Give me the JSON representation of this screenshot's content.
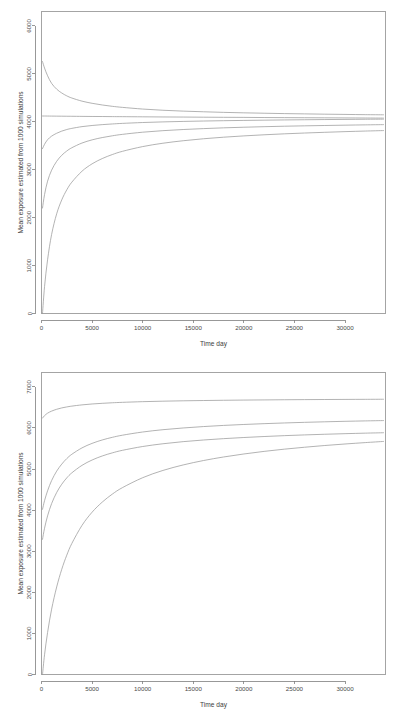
{
  "figure": {
    "background_color": "#ffffff",
    "line_color": "#9a9a9a",
    "axis_color": "#7e7e7e",
    "panel_count": 2
  },
  "chart_data": [
    {
      "id": "top-panel",
      "type": "line",
      "title": "",
      "xlabel": "Time day",
      "ylabel": "Mean exposure estimated from 1000 simulations",
      "xlim": [
        0,
        34000
      ],
      "ylim": [
        0,
        6300
      ],
      "xticks": [
        0,
        5000,
        10000,
        15000,
        20000,
        25000,
        30000
      ],
      "xticklabels": [
        "0",
        "5000",
        "10000",
        "15000",
        "20000",
        "25000",
        "30000"
      ],
      "yticks": [
        0,
        1000,
        2000,
        3000,
        4000,
        5000,
        6000
      ],
      "yticklabels": [
        "0",
        "1000",
        "2000",
        "3000",
        "4000",
        "5000",
        "6000"
      ],
      "grid": false,
      "legend": "none",
      "x": [
        100,
        300,
        600,
        1000,
        1500,
        2000,
        2500,
        3000,
        4000,
        5000,
        6000,
        7000,
        8000,
        10000,
        12000,
        14000,
        16000,
        18000,
        20000,
        22000,
        24000,
        26000,
        28000,
        30000,
        32000,
        33800
      ],
      "series": [
        {
          "name": "curve-1-decreasing",
          "values": [
            5255,
            5120,
            4960,
            4800,
            4680,
            4600,
            4540,
            4495,
            4430,
            4385,
            4350,
            4322,
            4300,
            4265,
            4240,
            4222,
            4208,
            4196,
            4186,
            4178,
            4170,
            4164,
            4158,
            4153,
            4148,
            4145
          ]
        },
        {
          "name": "curve-2-flat",
          "values": [
            4120,
            4120,
            4119,
            4118,
            4117,
            4116,
            4115,
            4114,
            4112,
            4110,
            4109,
            4107,
            4106,
            4103,
            4100,
            4098,
            4095,
            4093,
            4091,
            4088,
            4086,
            4084,
            4082,
            4080,
            4078,
            4076
          ]
        },
        {
          "name": "curve-3-rising-high",
          "values": [
            3440,
            3530,
            3625,
            3700,
            3760,
            3805,
            3838,
            3862,
            3898,
            3922,
            3940,
            3954,
            3966,
            3984,
            3997,
            4007,
            4015,
            4022,
            4028,
            4033,
            4038,
            4042,
            4046,
            4049,
            4052,
            4054
          ]
        },
        {
          "name": "curve-4-rising-mid",
          "values": [
            2200,
            2480,
            2760,
            2990,
            3175,
            3300,
            3390,
            3458,
            3556,
            3622,
            3670,
            3707,
            3737,
            3782,
            3814,
            3838,
            3857,
            3873,
            3886,
            3897,
            3907,
            3915,
            3922,
            3929,
            3935,
            3940
          ]
        },
        {
          "name": "curve-5-rising-low",
          "values": [
            0,
            560,
            1120,
            1650,
            2080,
            2370,
            2580,
            2740,
            2968,
            3122,
            3232,
            3316,
            3383,
            3482,
            3552,
            3604,
            3645,
            3678,
            3705,
            3728,
            3748,
            3765,
            3780,
            3794,
            3806,
            3816
          ]
        }
      ]
    },
    {
      "id": "bottom-panel",
      "type": "line",
      "title": "",
      "xlabel": "Time day",
      "ylabel": "Mean exposure estimated from 1000 simulations",
      "xlim": [
        0,
        34000
      ],
      "ylim": [
        0,
        7350
      ],
      "xticks": [
        0,
        5000,
        10000,
        15000,
        20000,
        25000,
        30000
      ],
      "xticklabels": [
        "0",
        "5000",
        "10000",
        "15000",
        "20000",
        "25000",
        "30000"
      ],
      "yticks": [
        0,
        1000,
        2000,
        3000,
        4000,
        5000,
        6000,
        7000
      ],
      "yticklabels": [
        "0",
        "1000",
        "2000",
        "3000",
        "4000",
        "5000",
        "6000",
        "7000"
      ],
      "grid": false,
      "legend": "none",
      "x": [
        100,
        300,
        600,
        1000,
        1500,
        2000,
        2500,
        3000,
        4000,
        5000,
        6000,
        7000,
        8000,
        10000,
        12000,
        14000,
        16000,
        18000,
        20000,
        22000,
        24000,
        26000,
        28000,
        30000,
        32000,
        33800
      ],
      "series": [
        {
          "name": "curve-1-top",
          "values": [
            6240,
            6300,
            6360,
            6410,
            6455,
            6488,
            6512,
            6532,
            6562,
            6584,
            6600,
            6613,
            6624,
            6640,
            6652,
            6661,
            6668,
            6674,
            6679,
            6683,
            6687,
            6690,
            6693,
            6695,
            6697,
            6699
          ]
        },
        {
          "name": "curve-2-upper-mid",
          "values": [
            4020,
            4230,
            4470,
            4720,
            4950,
            5120,
            5255,
            5360,
            5515,
            5625,
            5708,
            5772,
            5824,
            5902,
            5958,
            6000,
            6034,
            6062,
            6085,
            6105,
            6122,
            6137,
            6150,
            6162,
            6172,
            6180
          ]
        },
        {
          "name": "curve-3-lower-mid",
          "values": [
            3290,
            3560,
            3860,
            4160,
            4430,
            4630,
            4785,
            4908,
            5090,
            5220,
            5318,
            5394,
            5456,
            5549,
            5616,
            5667,
            5707,
            5740,
            5768,
            5792,
            5813,
            5831,
            5847,
            5861,
            5874,
            5884
          ]
        },
        {
          "name": "curve-4-bottom",
          "values": [
            0,
            480,
            1020,
            1590,
            2130,
            2560,
            2905,
            3190,
            3628,
            3950,
            4195,
            4390,
            4548,
            4790,
            4966,
            5100,
            5207,
            5294,
            5367,
            5430,
            5484,
            5531,
            5573,
            5610,
            5644,
            5672
          ]
        }
      ]
    }
  ]
}
